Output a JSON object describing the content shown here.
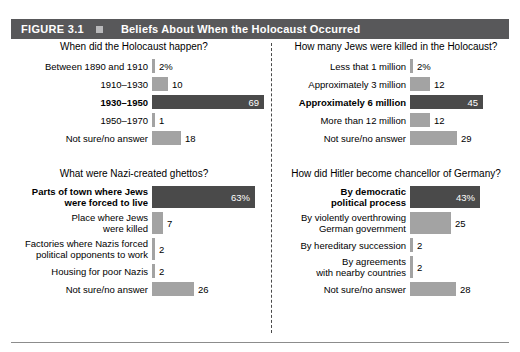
{
  "header": {
    "figure_number": "FIGURE 3.1",
    "marker_icon": "square-marker-icon",
    "title": "Beliefs About When the Holocaust Occurred",
    "banner_color": "#58585a",
    "text_color": "#ffffff"
  },
  "style": {
    "bar_color_light": "#a3a3a3",
    "bar_color_dark": "#4a4a4a",
    "px_per_unit": 1.63
  },
  "chart_data": [
    {
      "id": "when-did-the-holocaust-happen",
      "type": "bar",
      "orientation": "horizontal",
      "title": "When did the Holocaust happen?",
      "xlabel": "",
      "ylabel": "",
      "xlim": [
        0,
        100
      ],
      "grid": false,
      "legend": "none",
      "categories": [
        "Between 1890 and 1910",
        "1910–1930",
        "1930–1950",
        "1950–1970",
        "Not sure/no answer"
      ],
      "values": [
        2,
        10,
        69,
        1,
        18
      ],
      "value_labels": [
        "2%",
        "10",
        "69",
        "1",
        "18"
      ],
      "highlighted": [
        false,
        false,
        true,
        false,
        false
      ]
    },
    {
      "id": "how-many-jews-were-killed",
      "type": "bar",
      "orientation": "horizontal",
      "title": "How many Jews were killed in the Holocaust?",
      "xlabel": "",
      "ylabel": "",
      "xlim": [
        0,
        100
      ],
      "grid": false,
      "legend": "none",
      "categories": [
        "Less that 1 million",
        "Approximately 3 million",
        "Approximately 6 million",
        "More than 12 million",
        "Not sure/no answer"
      ],
      "values": [
        2,
        12,
        45,
        12,
        29
      ],
      "value_labels": [
        "2%",
        "12",
        "45",
        "12",
        "29"
      ],
      "highlighted": [
        false,
        false,
        true,
        false,
        false
      ]
    },
    {
      "id": "what-were-nazi-created-ghettos",
      "type": "bar",
      "orientation": "horizontal",
      "title": "What were Nazi-created ghettos?",
      "xlabel": "",
      "ylabel": "",
      "xlim": [
        0,
        100
      ],
      "grid": false,
      "legend": "none",
      "categories": [
        "Parts of town where Jews\nwere forced to live",
        "Place where Jews\nwere killed",
        "Factories where Nazis forced\npolitical opponents to work",
        "Housing for poor Nazis",
        "Not sure/no answer"
      ],
      "values": [
        63,
        7,
        2,
        2,
        26
      ],
      "value_labels": [
        "63%",
        "7",
        "2",
        "2",
        "26"
      ],
      "highlighted": [
        true,
        false,
        false,
        false,
        false
      ]
    },
    {
      "id": "how-did-hitler-become-chancellor",
      "type": "bar",
      "orientation": "horizontal",
      "title": "How did Hitler become chancellor of Germany?",
      "xlabel": "",
      "ylabel": "",
      "xlim": [
        0,
        100
      ],
      "grid": false,
      "legend": "none",
      "categories": [
        "By democratic\npolitical process",
        "By violently overthrowing\nGerman government",
        "By hereditary succession",
        "By agreements\nwith nearby countries",
        "Not sure/no answer"
      ],
      "values": [
        43,
        25,
        2,
        2,
        28
      ],
      "value_labels": [
        "43%",
        "25",
        "2",
        "2",
        "28"
      ],
      "highlighted": [
        true,
        false,
        false,
        false,
        false
      ]
    }
  ]
}
